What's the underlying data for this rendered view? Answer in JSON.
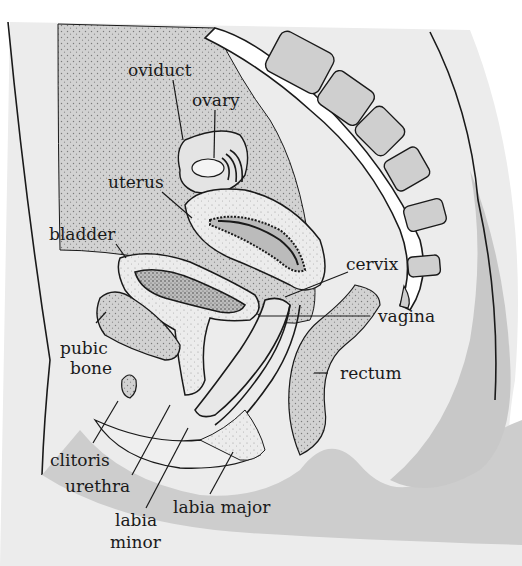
{
  "diagram": {
    "colors": {
      "background": "#ffffff",
      "skin_region": "#ececec",
      "abdominal_region": "#d6d6d6",
      "dark_tissue": "#c6c6c6",
      "outline": "#1a1a1a",
      "vertebra_fill": "#cfcfcf"
    },
    "labels": {
      "oviduct": "oviduct",
      "ovary": "ovary",
      "uterus": "uterus",
      "bladder": "bladder",
      "cervix": "cervix",
      "pubic_line1": "pubic",
      "pubic_line2": "bone",
      "vagina": "vagina",
      "rectum": "rectum",
      "clitoris": "clitoris",
      "urethra": "urethra",
      "labia_major": "labia major",
      "labia_minor_line1": "labia",
      "labia_minor_line2": "minor"
    }
  }
}
